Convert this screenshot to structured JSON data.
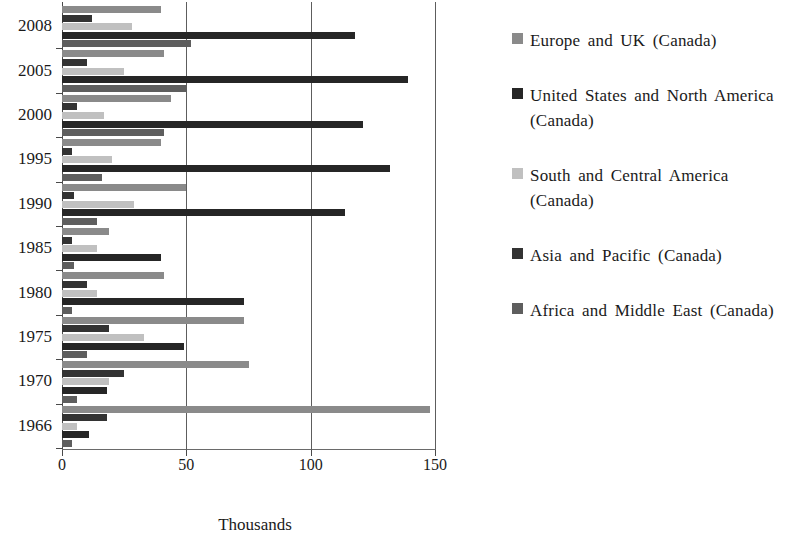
{
  "chart_data": {
    "type": "bar",
    "orientation": "horizontal",
    "title": "",
    "xlabel": "Thousands",
    "ylabel": "",
    "xlim": [
      0,
      150
    ],
    "xticks": [
      0,
      50,
      100,
      150
    ],
    "xtick_labels": [
      "0",
      "50",
      "100",
      "150"
    ],
    "grid": true,
    "grid_axis": "x",
    "legend_position": "right",
    "categories": [
      "2008",
      "2005",
      "2000",
      "1995",
      "1990",
      "1985",
      "1980",
      "1975",
      "1970",
      "1966"
    ],
    "series": [
      {
        "name": "Europe and UK (Canada)",
        "color": "#8a8a8a",
        "values": [
          40,
          41,
          44,
          40,
          50,
          19,
          41,
          73,
          75,
          148
        ]
      },
      {
        "name": "United States and North America (Canada)",
        "color": "#262626",
        "values": [
          118,
          139,
          121,
          132,
          114,
          40,
          73,
          49,
          18,
          11
        ]
      },
      {
        "name": "South and Central America (Canada)",
        "color": "#c0c0c0",
        "values": [
          28,
          25,
          17,
          20,
          29,
          14,
          14,
          33,
          19,
          6
        ]
      },
      {
        "name": "Asia and Pacific (Canada)",
        "color": "#333333",
        "values": [
          12,
          10,
          6,
          4,
          5,
          4,
          10,
          19,
          25,
          18
        ]
      },
      {
        "name": "Africa and Middle East (Canada)",
        "color": "#5e5e5e",
        "values": [
          52,
          50,
          41,
          16,
          14,
          5,
          4,
          10,
          6,
          4
        ]
      }
    ],
    "bar_draw_order": [
      "Europe and UK (Canada)",
      "Asia and Pacific (Canada)",
      "South and Central America (Canada)",
      "United States and North America (Canada)",
      "Africa and Middle East (Canada)"
    ]
  },
  "legend": {
    "items": [
      {
        "label": "Europe  and  UK (Canada)",
        "color": "#8a8a8a",
        "swatch_name": "legend-swatch-europe-uk"
      },
      {
        "label": "United  States  and  North America  (Canada)",
        "color": "#262626",
        "swatch_name": "legend-swatch-united-states"
      },
      {
        "label": "South  and  Central  America (Canada)",
        "color": "#c0c0c0",
        "swatch_name": "legend-swatch-south-central-america"
      },
      {
        "label": "Asia  and  Pacific  (Canada)",
        "color": "#333333",
        "swatch_name": "legend-swatch-asia-pacific"
      },
      {
        "label": "Africa  and  Middle  East (Canada)",
        "color": "#5e5e5e",
        "swatch_name": "legend-swatch-africa-middle-east"
      }
    ]
  },
  "axis": {
    "x_title": "Thousands",
    "x_tick_labels": [
      "0",
      "50",
      "100",
      "150"
    ],
    "y_tick_labels": [
      "2008",
      "2005",
      "2000",
      "1995",
      "1990",
      "1985",
      "1980",
      "1975",
      "1970",
      "1966"
    ]
  }
}
